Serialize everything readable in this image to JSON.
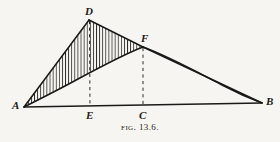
{
  "figure": {
    "caption_prefix": "Fig.",
    "caption_number": "13.6.",
    "background_color": "#f7f5f1",
    "ink_color": "#1a1a18",
    "hatch_color": "#2a2a26"
  },
  "labels": {
    "a": "A",
    "b": "B",
    "c": "C",
    "d": "D",
    "e": "E",
    "f": "F"
  },
  "geometry": {
    "points": {
      "A": [
        24,
        107
      ],
      "B": [
        262,
        103
      ],
      "C": [
        143,
        106
      ],
      "D": [
        89,
        20
      ],
      "E": [
        90,
        107
      ],
      "F": [
        143,
        47
      ]
    },
    "baseline": "A-B",
    "broken_line": "A-D-F-B",
    "curve": "A-F-B",
    "dashed_verticals": [
      "D-E",
      "F-C"
    ],
    "hatched_regions": [
      "between chord A-D-F and curve A-F",
      "between chord F-B and curve F-B"
    ],
    "hatch_style": "vertical-lines"
  }
}
